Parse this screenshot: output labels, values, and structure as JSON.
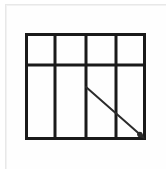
{
  "document": {
    "title": "Grid Panel Schematic",
    "background_color": "#ffffff",
    "frame_color": "#e8e8e8"
  },
  "diagram": {
    "name": "panel-grid-with-diagonal-arrow",
    "type": "line-drawing",
    "stroke_color": "#1a1a1a",
    "stroke_width": 3,
    "thin_stroke_width": 2,
    "arrow_color": "#2b2b2b",
    "arrow_stroke_width": 2,
    "outline": {
      "left": 25,
      "top": 33,
      "right": 146,
      "bottom": 140,
      "width": 121,
      "height": 107
    },
    "vertical_mullions_x": [
      25,
      55,
      86,
      116,
      146
    ],
    "horizontal_rails_y": [
      33,
      65,
      140
    ],
    "columns": 4,
    "rows": 2,
    "row_heights": [
      32,
      75
    ],
    "column_width": 30,
    "cells_top_row": [
      {
        "name": "transom-pane-1",
        "x": 25,
        "y": 33,
        "w": 30,
        "h": 32
      },
      {
        "name": "transom-pane-2",
        "x": 55,
        "y": 33,
        "w": 31,
        "h": 32
      },
      {
        "name": "transom-pane-3",
        "x": 86,
        "y": 33,
        "w": 30,
        "h": 32
      },
      {
        "name": "transom-pane-4",
        "x": 116,
        "y": 33,
        "w": 30,
        "h": 32
      }
    ],
    "cells_bottom_row": [
      {
        "name": "main-pane-1",
        "x": 25,
        "y": 65,
        "w": 30,
        "h": 75
      },
      {
        "name": "main-pane-2",
        "x": 55,
        "y": 65,
        "w": 31,
        "h": 75
      },
      {
        "name": "main-pane-3",
        "x": 86,
        "y": 65,
        "w": 30,
        "h": 75
      },
      {
        "name": "main-pane-4",
        "x": 116,
        "y": 65,
        "w": 30,
        "h": 75
      }
    ],
    "arrow": {
      "name": "diagonal-direction-arrow",
      "start_x": 86,
      "start_y": 87,
      "end_x": 145,
      "end_y": 139,
      "head_size": 7,
      "direction": "down-right"
    }
  }
}
